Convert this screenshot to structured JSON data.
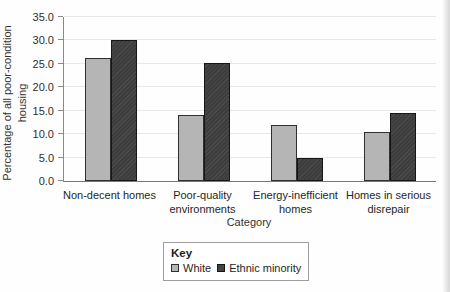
{
  "colors": {
    "axis": "#8a8a8a",
    "grid": "#e7e7e7",
    "text": "#2b2b2b",
    "legend_border": "#9e9e9e",
    "scan_edge": "#d6d6d6",
    "white_series_fill": "#b5b5b5",
    "ethnic_minority_series_fill": "#3d3d3d"
  },
  "chart_data": {
    "type": "bar",
    "title": "",
    "categories": [
      "Non-decent homes",
      "Poor-quality environments",
      "Energy-inefficient homes",
      "Homes in serious disrepair"
    ],
    "category_label_lines": [
      [
        "Non-decent homes"
      ],
      [
        "Poor-quality",
        "environments"
      ],
      [
        "Energy-inefficient",
        "homes"
      ],
      [
        "Homes in serious",
        "disrepair"
      ]
    ],
    "series": [
      {
        "name": "White",
        "key": "white",
        "fill": "#b5b5b5",
        "fill2": "#b5b5b5",
        "border": "#2f2f2f",
        "hatch": false,
        "values": [
          26.2,
          14.1,
          12.0,
          10.4
        ]
      },
      {
        "name": "Ethnic minority",
        "key": "ethnic-minority",
        "fill": "#3d3d3d",
        "fill2": "#4a4a4a",
        "border": "#161616",
        "hatch": true,
        "values": [
          30.2,
          25.1,
          5.0,
          14.6
        ]
      }
    ],
    "xlabel": "Category",
    "ylabel": "Percentage of all poor-condition housing",
    "ylabel_lines": [
      "Percentage of all poor-condition",
      "housing"
    ],
    "ylim": [
      0,
      35
    ],
    "yticks": [
      0,
      5,
      10,
      15,
      20,
      25,
      30,
      35
    ],
    "ytick_labels": [
      "0.0",
      "5.0",
      "10.0",
      "15.0",
      "20.0",
      "25.0",
      "30.0",
      "35.0"
    ],
    "grid": "horizontal",
    "legend_title": "Key",
    "legend_position": "bottom-center"
  }
}
